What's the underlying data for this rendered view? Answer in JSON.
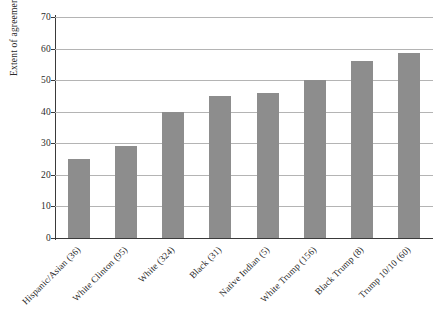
{
  "chart_data": {
    "type": "bar",
    "title": "",
    "subtitle": "",
    "xlabel": "",
    "ylabel": "Extent of agreement",
    "ylim": [
      0,
      70
    ],
    "yticks": [
      0,
      10,
      20,
      30,
      40,
      50,
      60,
      70
    ],
    "ytick_labels": [
      "0",
      "10",
      "20",
      "30",
      "40",
      "50",
      "60",
      "70"
    ],
    "grid": true,
    "legend": null,
    "bar_color": "#8d8d8d",
    "categories": [
      "Hispanic/Asian (36)",
      "White Clinton (95)",
      "White (324)",
      "Black (31)",
      "Native Indian (5)",
      "White Trump (156)",
      "Black Trump (8)",
      "Trump 10/10 (60)"
    ],
    "values": [
      25,
      29,
      40,
      45,
      46,
      50,
      56,
      58.5
    ]
  },
  "axes": {
    "y_axis_title": "Extent of agreement"
  }
}
